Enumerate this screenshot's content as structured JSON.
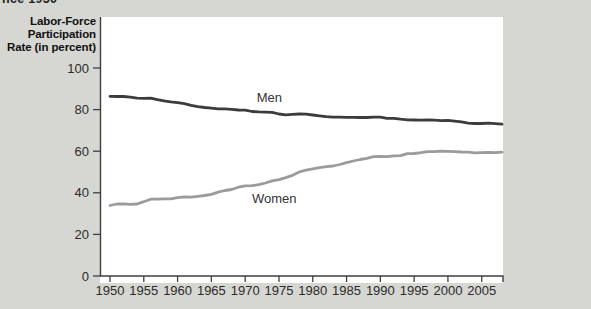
{
  "figure": {
    "cropped_title_fragment": "nce 1950"
  },
  "colors": {
    "background": "#d6d6d2",
    "plot_background": "#ffffff",
    "axis": "#3f3f3f",
    "tick_text": "#2b2b2b",
    "series_label_text": "#333333",
    "men_line": "#3c3c3c",
    "women_line": "#9b9b9b"
  },
  "chart_data": {
    "type": "line",
    "title": "",
    "xlabel": "",
    "ylabel": "Labor-Force Participation Rate (in percent)",
    "ylabel_lines": [
      "Labor-Force",
      "Participation",
      "Rate (in percent)"
    ],
    "grid": false,
    "legend_position": "inline-labels",
    "x_range": [
      1950,
      2008
    ],
    "y_range": [
      0,
      100
    ],
    "x_ticks": [
      1950,
      1955,
      1960,
      1965,
      1970,
      1975,
      1980,
      1985,
      1990,
      1995,
      2000,
      2005
    ],
    "y_ticks": [
      0,
      20,
      40,
      60,
      80,
      100
    ],
    "x_start": 1950,
    "x_step": 1,
    "series": [
      {
        "name": "Men",
        "color": "#3c3c3c",
        "label_pos": {
          "x": 1971.7,
          "y": 83.7
        },
        "values": [
          86.4,
          86.3,
          86.3,
          86.0,
          85.5,
          85.4,
          85.5,
          84.8,
          84.2,
          83.7,
          83.3,
          82.9,
          82.0,
          81.4,
          81.0,
          80.7,
          80.4,
          80.4,
          80.1,
          79.8,
          79.7,
          79.1,
          78.9,
          78.8,
          78.7,
          77.9,
          77.5,
          77.7,
          77.9,
          77.8,
          77.4,
          77.0,
          76.6,
          76.4,
          76.4,
          76.3,
          76.3,
          76.2,
          76.2,
          76.4,
          76.4,
          75.8,
          75.8,
          75.4,
          75.1,
          75.0,
          74.9,
          75.0,
          74.9,
          74.7,
          74.8,
          74.4,
          74.1,
          73.5,
          73.3,
          73.3,
          73.5,
          73.2,
          73.0
        ]
      },
      {
        "name": "Women",
        "color": "#9b9b9b",
        "label_pos": {
          "x": 1971.0,
          "y": 35.1
        },
        "values": [
          33.9,
          34.6,
          34.7,
          34.4,
          34.6,
          35.7,
          36.9,
          36.9,
          37.1,
          37.1,
          37.7,
          38.1,
          37.9,
          38.3,
          38.7,
          39.3,
          40.3,
          41.1,
          41.6,
          42.7,
          43.3,
          43.4,
          43.9,
          44.7,
          45.7,
          46.3,
          47.3,
          48.4,
          50.0,
          50.9,
          51.5,
          52.1,
          52.6,
          52.9,
          53.6,
          54.5,
          55.3,
          56.0,
          56.6,
          57.4,
          57.5,
          57.4,
          57.8,
          57.9,
          58.8,
          58.9,
          59.3,
          59.8,
          59.8,
          60.0,
          59.9,
          59.8,
          59.6,
          59.5,
          59.2,
          59.3,
          59.4,
          59.3,
          59.5
        ]
      }
    ]
  }
}
